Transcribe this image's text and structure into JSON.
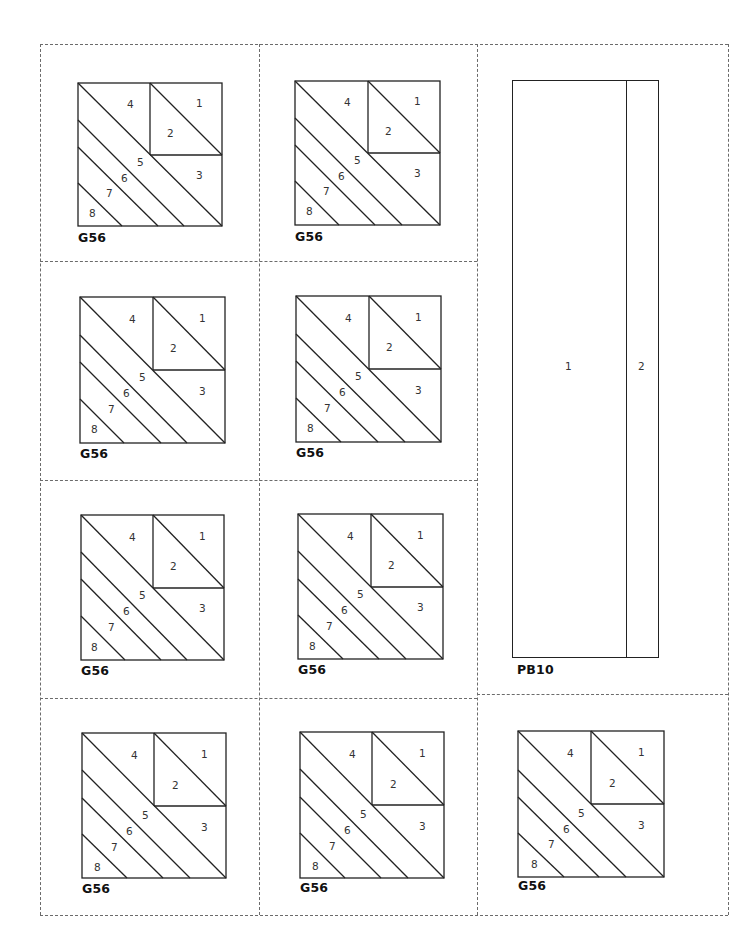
{
  "page": {
    "type": "foundation piecing pattern sheet",
    "line_color": "#222222",
    "dash_color": "#6b6b6b"
  },
  "blocks": [
    {
      "id": "b1",
      "label": "G56",
      "pieces": [
        "1",
        "2",
        "3",
        "4",
        "5",
        "6",
        "7",
        "8"
      ]
    },
    {
      "id": "b2",
      "label": "G56",
      "pieces": [
        "1",
        "2",
        "3",
        "4",
        "5",
        "6",
        "7",
        "8"
      ]
    },
    {
      "id": "b3",
      "label": "G56",
      "pieces": [
        "1",
        "2",
        "3",
        "4",
        "5",
        "6",
        "7",
        "8"
      ]
    },
    {
      "id": "b4",
      "label": "G56",
      "pieces": [
        "1",
        "2",
        "3",
        "4",
        "5",
        "6",
        "7",
        "8"
      ]
    },
    {
      "id": "b5",
      "label": "G56",
      "pieces": [
        "1",
        "2",
        "3",
        "4",
        "5",
        "6",
        "7",
        "8"
      ]
    },
    {
      "id": "b6",
      "label": "G56",
      "pieces": [
        "1",
        "2",
        "3",
        "4",
        "5",
        "6",
        "7",
        "8"
      ]
    },
    {
      "id": "b7",
      "label": "G56",
      "pieces": [
        "1",
        "2",
        "3",
        "4",
        "5",
        "6",
        "7",
        "8"
      ]
    },
    {
      "id": "b8",
      "label": "G56",
      "pieces": [
        "1",
        "2",
        "3",
        "4",
        "5",
        "6",
        "7",
        "8"
      ]
    },
    {
      "id": "b9",
      "label": "G56",
      "pieces": [
        "1",
        "2",
        "3",
        "4",
        "5",
        "6",
        "7",
        "8"
      ]
    }
  ],
  "strip": {
    "label": "PB10",
    "pieces": [
      "1",
      "2"
    ]
  }
}
